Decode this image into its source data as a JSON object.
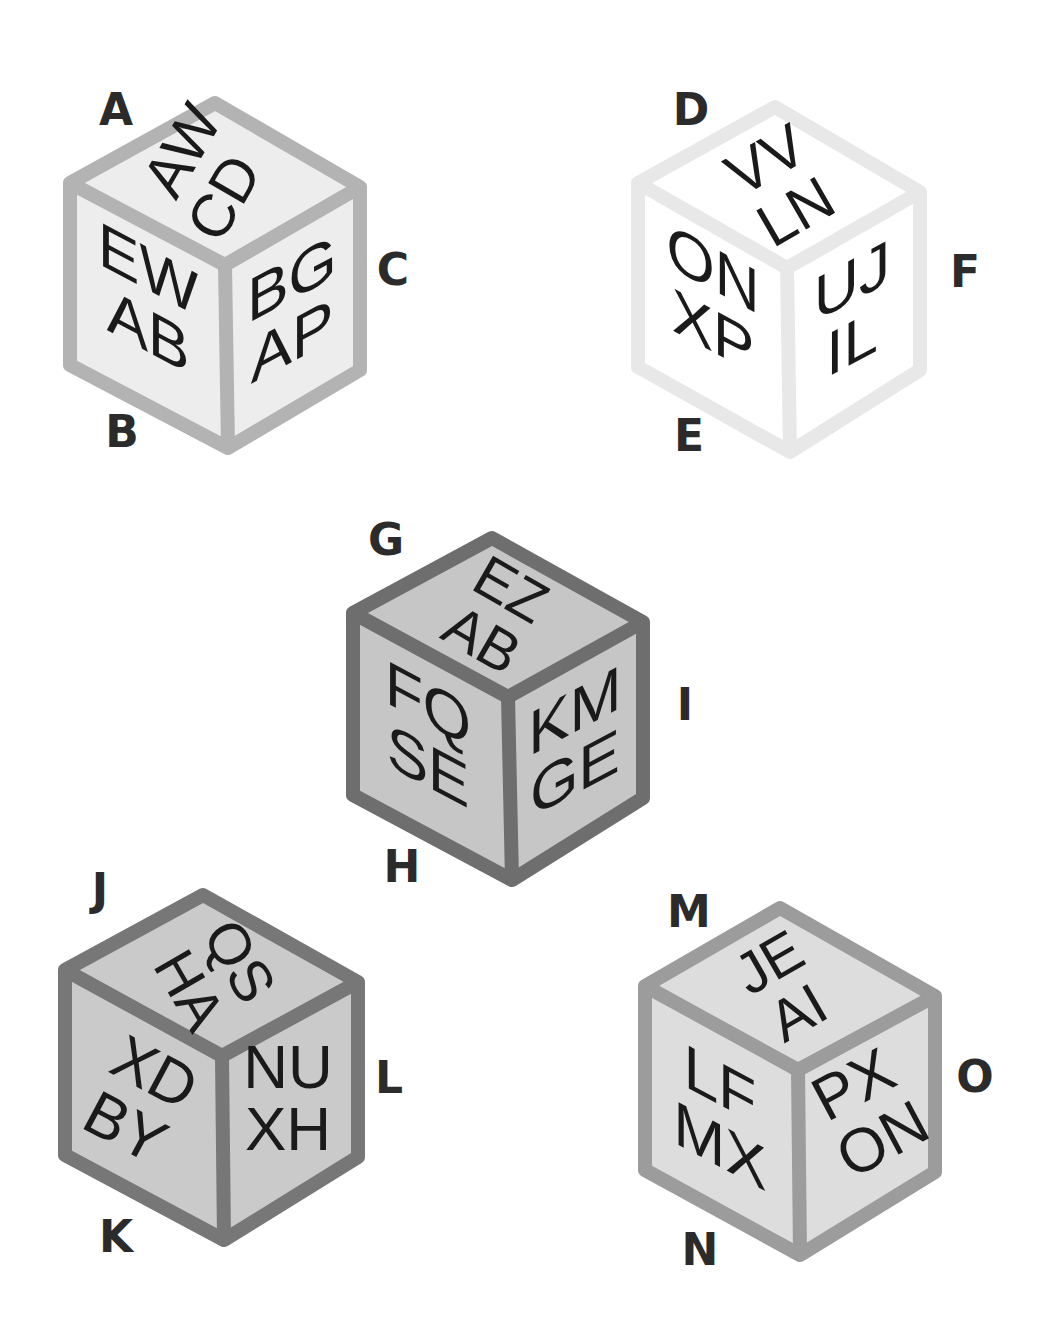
{
  "cubes": [
    {
      "id": 1,
      "colors": {
        "border": "#b3b3b3",
        "face": "#ededed"
      },
      "labels": {
        "top_left": "A",
        "bottom_left": "B",
        "right": "C"
      },
      "faces": {
        "top": {
          "line1": "AW",
          "line2": "CD"
        },
        "left": {
          "line1": "EW",
          "line2": "AB"
        },
        "right": {
          "line1": "BG",
          "line2": "AP"
        }
      }
    },
    {
      "id": 2,
      "colors": {
        "border": "#e8e8e8",
        "face": "#ffffff"
      },
      "labels": {
        "top_left": "D",
        "bottom_left": "E",
        "right": "F"
      },
      "faces": {
        "top": {
          "line1": "VV",
          "line2": "LN"
        },
        "left": {
          "line1": "ON",
          "line2": "XP"
        },
        "right": {
          "line1": "UJ",
          "line2": "IL"
        }
      }
    },
    {
      "id": 3,
      "colors": {
        "border": "#6e6e6e",
        "face": "#c6c6c6"
      },
      "labels": {
        "top_left": "G",
        "bottom_left": "H",
        "right": "I"
      },
      "faces": {
        "top": {
          "line1": "EZ",
          "line2": "AB"
        },
        "left": {
          "line1": "FQ",
          "line2": "SE"
        },
        "right": {
          "line1": "KM",
          "line2": "GE"
        }
      }
    },
    {
      "id": 4,
      "colors": {
        "border": "#777777",
        "face": "#cacaca"
      },
      "labels": {
        "top_left": "J",
        "bottom_left": "K",
        "right": "L"
      },
      "faces": {
        "top": {
          "line1": "QS",
          "line2": "HA"
        },
        "left": {
          "line1": "XD",
          "line2": "BY"
        },
        "right": {
          "line1": "NU",
          "line2": "XH"
        }
      }
    },
    {
      "id": 5,
      "colors": {
        "border": "#9c9c9c",
        "face": "#dddddd"
      },
      "labels": {
        "top_left": "M",
        "bottom_left": "N",
        "right": "O"
      },
      "faces": {
        "top": {
          "line1": "JE",
          "line2": "AI"
        },
        "left": {
          "line1": "LF",
          "line2": "MX"
        },
        "right": {
          "line1": "PX",
          "line2": "ON"
        }
      }
    }
  ]
}
